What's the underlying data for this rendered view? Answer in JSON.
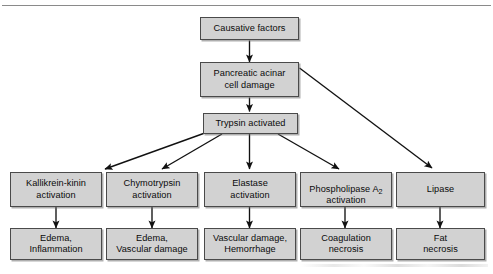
{
  "diagram": {
    "accent_fill": "#d2d2d2",
    "border_color": "#4a4a4a",
    "line_color": "#1a1a1a",
    "background": "#ffffff",
    "nodes": {
      "causative_factors": "Causative factors",
      "acinar_damage": "Pancreatic acinar\ncell damage",
      "trypsin": "Trypsin activated",
      "kallikrein": "Kallikrein-kinin\nactivation",
      "chymotrypsin": "Chymotrypsin\nactivation",
      "elastase": "Elastase\nactivation",
      "phospholipase_pre": "Phospholipase A",
      "phospholipase_sub": "2",
      "phospholipase_post": "activation",
      "lipase": "Lipase",
      "edema_inflammation": "Edema,\nInflammation",
      "edema_vascular": "Edema,\nVascular damage",
      "vascular_hemorrhage": "Vascular damage,\nHemorrhage",
      "coagulation_necrosis": "Coagulation\nnecrosis",
      "fat_necrosis": "Fat\nnecrosis"
    },
    "edges": [
      {
        "id": "causative-to-acinar",
        "from": "causative_factors",
        "to": "acinar_damage",
        "style": "vertical"
      },
      {
        "id": "acinar-to-trypsin",
        "from": "acinar_damage",
        "to": "trypsin",
        "style": "vertical"
      },
      {
        "id": "acinar-to-lipase",
        "from": "acinar_damage",
        "to": "lipase",
        "style": "diagonal"
      },
      {
        "id": "trypsin-to-kallikrein",
        "from": "trypsin",
        "to": "kallikrein",
        "style": "diagonal"
      },
      {
        "id": "trypsin-to-chymotrypsin",
        "from": "trypsin",
        "to": "chymotrypsin",
        "style": "diagonal"
      },
      {
        "id": "trypsin-to-elastase",
        "from": "trypsin",
        "to": "elastase",
        "style": "vertical"
      },
      {
        "id": "trypsin-to-phospholipase",
        "from": "trypsin",
        "to": "phospholipase",
        "style": "diagonal"
      },
      {
        "id": "kallikrein-to-edema-inflammation",
        "from": "kallikrein",
        "to": "edema_inflammation",
        "style": "vertical"
      },
      {
        "id": "chymotrypsin-to-edema-vascular",
        "from": "chymotrypsin",
        "to": "edema_vascular",
        "style": "vertical"
      },
      {
        "id": "elastase-to-vascular-hemorrhage",
        "from": "elastase",
        "to": "vascular_hemorrhage",
        "style": "vertical"
      },
      {
        "id": "phospholipase-to-coagulation",
        "from": "phospholipase",
        "to": "coagulation_necrosis",
        "style": "vertical"
      },
      {
        "id": "lipase-to-fat-necrosis",
        "from": "lipase",
        "to": "fat_necrosis",
        "style": "vertical"
      }
    ]
  }
}
